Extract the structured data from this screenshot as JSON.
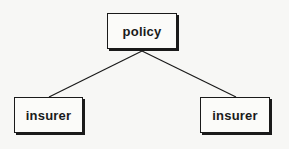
{
  "diagram": {
    "type": "tree",
    "nodes": [
      {
        "id": "policy",
        "label": "policy",
        "level": 0
      },
      {
        "id": "insurer-left",
        "label": "insurer",
        "level": 1
      },
      {
        "id": "insurer-right",
        "label": "insurer",
        "level": 1
      }
    ],
    "edges": [
      {
        "from": "policy",
        "to": "insurer-left"
      },
      {
        "from": "policy",
        "to": "insurer-right"
      }
    ],
    "colors": {
      "stroke": "#1a1a1a",
      "background": "#f7f7f5"
    }
  }
}
